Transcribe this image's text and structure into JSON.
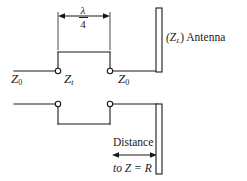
{
  "figure": {
    "background_color": "#ffffff",
    "line_color": "#1a1a1a",
    "text_color": "#1a1a1a"
  },
  "labels": {
    "z0_left": "Z",
    "z0_left_sub": "0",
    "zt": "Z",
    "zt_sub": "t",
    "z0_right": "Z",
    "z0_right_sub": "0",
    "antenna": "(Z",
    "antenna_sub": "L",
    "antenna_tail": ") Antenna",
    "lambda_numerator": "λ",
    "lambda_denominator": "4",
    "distance": "Distance",
    "to_z_equals_r": "to Z = R"
  },
  "dimensions": {
    "quarter_wave": {
      "label": "λ/4",
      "x_start": 58,
      "x_end": 110,
      "y": 16
    },
    "distance_to_load": {
      "label": "Distance to Z = R",
      "x_start": 113,
      "x_end": 157,
      "y": 155
    }
  },
  "conductors": {
    "upper": {
      "left_segment_y": 71,
      "raised_segment_y": 52,
      "right_segment_y": 71,
      "step_x_left": 58,
      "step_x_right": 110,
      "x_start": 14,
      "x_end": 157
    },
    "lower": {
      "left_segment_y": 104,
      "lowered_segment_y": 124,
      "right_segment_y": 104,
      "step_x_left": 58,
      "step_x_right": 110,
      "x_start": 14,
      "x_end": 157
    }
  },
  "terminals": [
    {
      "name": "upper-left-terminal",
      "x": 58,
      "y": 71
    },
    {
      "name": "upper-right-terminal",
      "x": 110,
      "y": 71
    },
    {
      "name": "lower-left-terminal",
      "x": 58,
      "y": 104
    },
    {
      "name": "lower-right-terminal",
      "x": 110,
      "y": 104
    }
  ],
  "antenna_elements": [
    {
      "name": "upper-antenna-element",
      "x": 156,
      "y": 8,
      "width": 6,
      "height": 64
    },
    {
      "name": "lower-antenna-element",
      "x": 156,
      "y": 104,
      "width": 6,
      "height": 70
    }
  ]
}
